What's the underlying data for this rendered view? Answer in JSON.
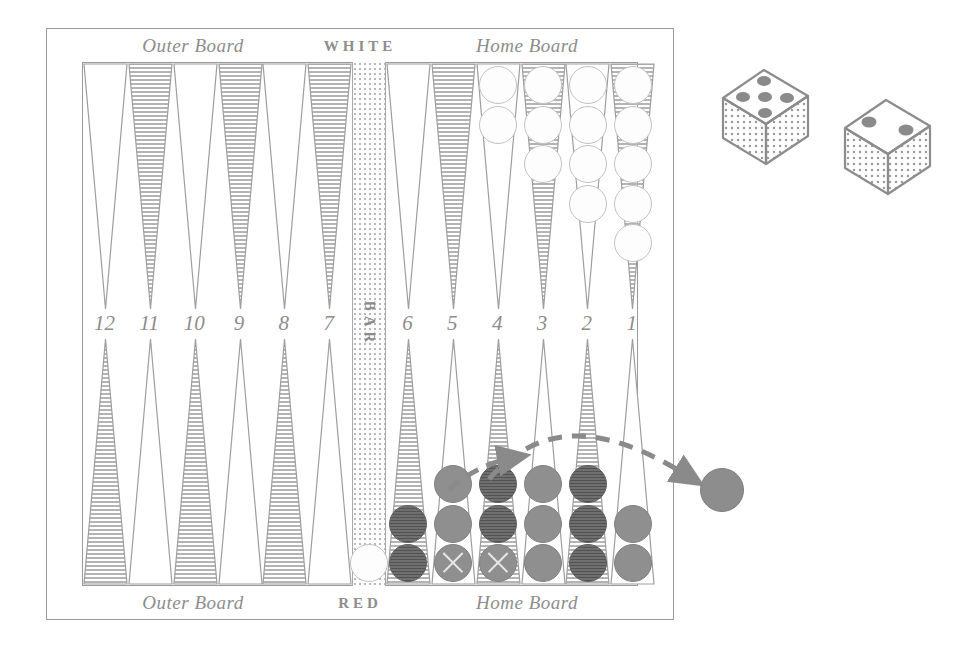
{
  "board": {
    "top_labels": {
      "outer_board": "Outer Board",
      "player": "WHITE",
      "home_board": "Home Board"
    },
    "bottom_labels": {
      "outer_board": "Outer Board",
      "player": "RED",
      "home_board": "Home Board"
    },
    "bar_label": "BAR",
    "point_numbers": [
      "12",
      "11",
      "10",
      "9",
      "8",
      "7",
      "6",
      "5",
      "4",
      "3",
      "2",
      "1"
    ],
    "colors": {
      "frame_line": "#9a9a9a",
      "point_outline": "#9e9e9e",
      "point_hatch": "#b4b4b4",
      "white_checker": "#fdfdfd",
      "red_checker_light": "#8f8f8f",
      "red_checker_dark": "#6f6f6f",
      "label_text": "#8d8d8d",
      "arrow": "#8a8a8a",
      "bar_fill": "#b9b9b9"
    },
    "point_styles": {
      "top": [
        "plain",
        "hatched",
        "plain",
        "hatched",
        "plain",
        "hatched",
        "plain",
        "hatched",
        "plain",
        "hatched",
        "plain",
        "hatched"
      ],
      "bottom": [
        "hatched",
        "plain",
        "hatched",
        "plain",
        "hatched",
        "plain",
        "hatched",
        "plain",
        "hatched",
        "plain",
        "hatched",
        "plain"
      ]
    }
  },
  "checkers": {
    "top": [
      {
        "point": "12",
        "color": "white",
        "count": 0
      },
      {
        "point": "11",
        "color": "white",
        "count": 0
      },
      {
        "point": "10",
        "color": "white",
        "count": 0
      },
      {
        "point": "9",
        "color": "white",
        "count": 0
      },
      {
        "point": "8",
        "color": "white",
        "count": 0
      },
      {
        "point": "7",
        "color": "white",
        "count": 0
      },
      {
        "point": "6",
        "color": "white",
        "count": 0
      },
      {
        "point": "5",
        "color": "white",
        "count": 0
      },
      {
        "point": "4",
        "color": "white",
        "count": 2
      },
      {
        "point": "3",
        "color": "white",
        "count": 3
      },
      {
        "point": "2",
        "color": "white",
        "count": 4
      },
      {
        "point": "1",
        "color": "white",
        "count": 5
      }
    ],
    "bottom": [
      {
        "point": "12",
        "color": "red",
        "count": 0
      },
      {
        "point": "11",
        "color": "red",
        "count": 0
      },
      {
        "point": "10",
        "color": "red",
        "count": 0
      },
      {
        "point": "9",
        "color": "red",
        "count": 0
      },
      {
        "point": "8",
        "color": "red",
        "count": 0
      },
      {
        "point": "7",
        "color": "red",
        "count": 0
      },
      {
        "point": "6",
        "color": "red",
        "count": 2,
        "shades": [
          "dark",
          "dark"
        ]
      },
      {
        "point": "5",
        "color": "red",
        "count": 3,
        "shades": [
          "light",
          "light",
          "light"
        ],
        "marked_index": 0
      },
      {
        "point": "4",
        "color": "red",
        "count": 3,
        "shades": [
          "light",
          "dark",
          "dark"
        ],
        "marked_index": 0
      },
      {
        "point": "3",
        "color": "red",
        "count": 3,
        "shades": [
          "light",
          "light",
          "light"
        ]
      },
      {
        "point": "2",
        "color": "red",
        "count": 3,
        "shades": [
          "dark",
          "dark",
          "dark"
        ]
      },
      {
        "point": "1",
        "color": "red",
        "count": 2,
        "shades": [
          "light",
          "light"
        ]
      }
    ],
    "bar": {
      "color": "white",
      "count": 1
    },
    "borne_off": {
      "color": "red",
      "count": 1
    }
  },
  "dice": [
    {
      "name": "die-left",
      "value": 5,
      "pips": [
        [
          0,
          0
        ],
        [
          2,
          0
        ],
        [
          1,
          1
        ],
        [
          0,
          2
        ],
        [
          2,
          2
        ]
      ]
    },
    {
      "name": "die-right",
      "value": 2,
      "pips": [
        [
          0,
          0
        ],
        [
          2,
          2
        ]
      ]
    }
  ],
  "arrows": [
    {
      "name": "move-arrow-short",
      "from_point": "5",
      "to_point": "2",
      "style": "dashed"
    },
    {
      "name": "move-arrow-bear-off",
      "from_point": "4",
      "to_point": "off",
      "style": "dashed"
    }
  ]
}
